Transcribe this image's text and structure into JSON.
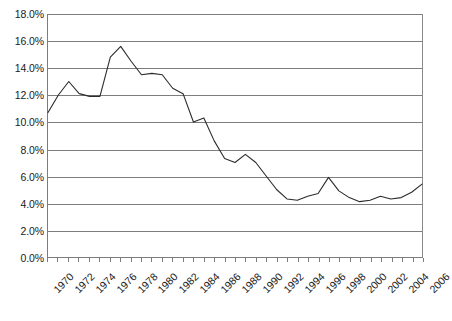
{
  "chart_data": {
    "type": "line",
    "title": "",
    "subtitle": "",
    "xlabel": "",
    "ylabel": "",
    "legend": [],
    "legend_position": "none",
    "grid": true,
    "grid_axis": "y",
    "ylim": [
      0.0,
      18.0
    ],
    "ytick_step": 2.0,
    "y_tick_labels": [
      "18.0%",
      "16.0%",
      "14.0%",
      "12.0%",
      "10.0%",
      "8.0%",
      "6.0%",
      "4.0%",
      "2.0%",
      "0.0%"
    ],
    "y_tick_values": [
      18.0,
      16.0,
      14.0,
      12.0,
      10.0,
      8.0,
      6.0,
      4.0,
      2.0,
      0.0
    ],
    "xlim": [
      1970,
      2006
    ],
    "x_tick_labels": [
      "1970",
      "1972",
      "1974",
      "1976",
      "1978",
      "1980",
      "1982",
      "1984",
      "1986",
      "1988",
      "1990",
      "1992",
      "1994",
      "1996",
      "1998",
      "2000",
      "2002",
      "2004",
      "2006"
    ],
    "x_tick_values": [
      1970,
      1972,
      1974,
      1976,
      1978,
      1980,
      1982,
      1984,
      1986,
      1988,
      1990,
      1992,
      1994,
      1996,
      1998,
      2000,
      2002,
      2004,
      2006
    ],
    "x_minor_ticks": [
      1970,
      1971,
      1972,
      1973,
      1974,
      1975,
      1976,
      1977,
      1978,
      1979,
      1980,
      1981,
      1982,
      1983,
      1984,
      1985,
      1986,
      1987,
      1988,
      1989,
      1990,
      1991,
      1992,
      1993,
      1994,
      1995,
      1996,
      1997,
      1998,
      1999,
      2000,
      2001,
      2002,
      2003,
      2004,
      2005,
      2006
    ],
    "x_label_rotation_degrees": -45,
    "series_color": "#2b2b2b",
    "grid_color": "#7d7d7d",
    "axis_color": "#7c7c7c",
    "x": [
      1970,
      1971,
      1972,
      1973,
      1974,
      1975,
      1976,
      1977,
      1978,
      1979,
      1980,
      1981,
      1982,
      1983,
      1984,
      1985,
      1986,
      1987,
      1988,
      1989,
      1990,
      1991,
      1992,
      1993,
      1994,
      1995,
      1996,
      1997,
      1998,
      1999,
      2000,
      2001,
      2002,
      2003,
      2004,
      2005,
      2006
    ],
    "values": [
      10.7,
      12.0,
      13.0,
      12.1,
      11.9,
      11.9,
      14.8,
      15.6,
      14.5,
      13.5,
      13.6,
      13.5,
      12.5,
      12.1,
      10.0,
      10.3,
      8.6,
      7.3,
      7.0,
      7.6,
      7.0,
      6.0,
      5.0,
      4.3,
      4.2,
      4.5,
      4.7,
      5.9,
      4.9,
      4.4,
      4.1,
      4.2,
      4.5,
      4.3,
      4.4,
      4.8,
      5.4
    ]
  }
}
